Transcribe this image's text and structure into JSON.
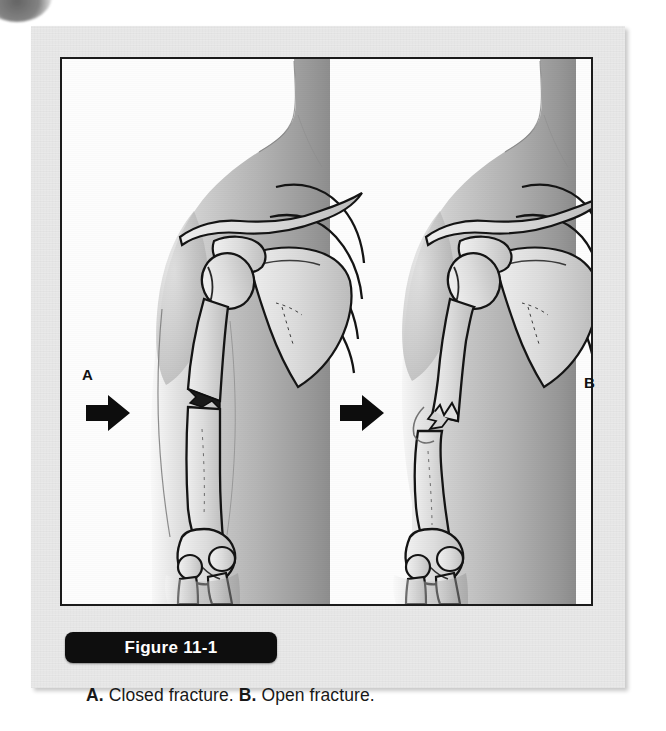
{
  "figure": {
    "tab_label": "Figure 11-1",
    "caption_a_letter": "A.",
    "caption_a_text": " Closed fracture. ",
    "caption_b_letter": "B.",
    "caption_b_text": " Open fracture.",
    "panel_a_letter": "A",
    "panel_b_letter": "B"
  },
  "panels": [
    {
      "id": "panel-a",
      "letter": "A",
      "fracture_type": "Closed fracture",
      "description": "Anterior view of shoulder and upper arm; humerus shaft fractured transversely with jagged edges, overlying skin intact",
      "arrow": "black-right-arrow pointing to mid-humerus fracture site",
      "bones_shown": [
        "clavicle",
        "acromion",
        "scapula",
        "humeral head",
        "humerus shaft",
        "ribs",
        "radius",
        "ulna"
      ]
    },
    {
      "id": "panel-b",
      "letter": "B",
      "fracture_type": "Open fracture",
      "description": "Anterior view of shoulder and upper arm; humerus fractured with angulation, sharp proximal bone end protruding through the skin",
      "arrow": "black-right-arrow pointing to protruding bone end",
      "bones_shown": [
        "clavicle",
        "acromion",
        "scapula",
        "humeral head",
        "humerus shaft",
        "ribs",
        "radius",
        "ulna"
      ]
    }
  ],
  "colors": {
    "panel_background": "#e9e9e9",
    "art_background": "#fdfdfd",
    "art_border": "#1b1b1b",
    "tab_background": "#0e0e0e",
    "tab_text": "#ffffff",
    "caption_text": "#181818",
    "skin_tone": "#b9b9b9",
    "bone_tone": "#d8d8d8",
    "arrow_color": "#0d0d0d"
  }
}
